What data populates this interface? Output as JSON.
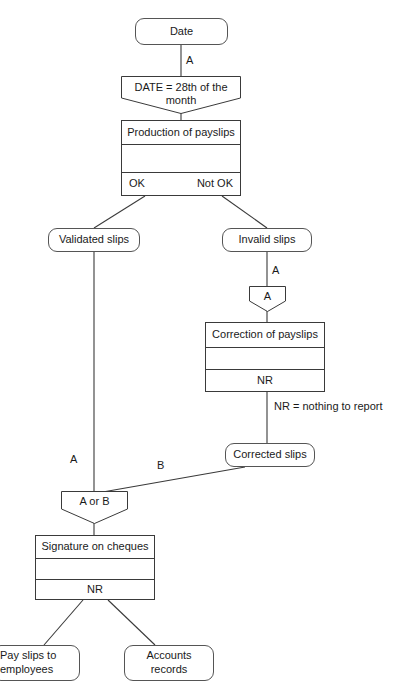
{
  "diagram": {
    "colors": {
      "stroke": "#3a3a3a",
      "terminator_stroke": "#555555",
      "background": "#ffffff",
      "text": "#1a1a1a"
    },
    "terminators": {
      "date": "Date",
      "validated_slips": "Validated slips",
      "invalid_slips": "Invalid slips",
      "corrected_slips": "Corrected slips",
      "pay_slips_to_employees": "Pay slips to\nemployees",
      "pay_slips_line1": "Pay slips to",
      "pay_slips_line2": "employees",
      "accounts_records_line1": "Accounts",
      "accounts_records_line2": "records"
    },
    "decisions": {
      "date_condition_line1": "DATE = 28th of the",
      "date_condition_line2": "month",
      "connector_a": "A",
      "connector_a_or_b": "A or B"
    },
    "processes": {
      "production": {
        "title": "Production of payslips",
        "middle": "",
        "bottom_left": "OK",
        "bottom_right": "Not OK"
      },
      "correction": {
        "title": "Correction of payslips",
        "middle": "",
        "bottom": "NR"
      },
      "signature": {
        "title": "Signature on cheques",
        "middle": "",
        "bottom": "NR"
      }
    },
    "edge_labels": {
      "date_to_condition": "A",
      "invalid_to_connector": "A",
      "validated_to_aorb": "A",
      "corrected_to_aorb": "B"
    },
    "notes": {
      "nr_legend": "NR = nothing to report"
    }
  }
}
